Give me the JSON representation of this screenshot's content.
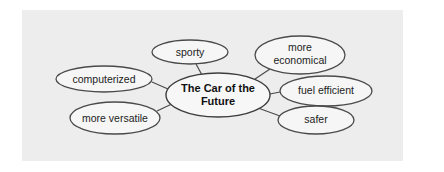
{
  "diagram": {
    "type": "concept-map",
    "center": {
      "label_line1": "The Car of the",
      "label_line2": "Future"
    },
    "nodes": [
      {
        "id": "sporty",
        "label_line1": "sporty"
      },
      {
        "id": "computerized",
        "label_line1": "computerized"
      },
      {
        "id": "more-versatile",
        "label_line1": "more versatile"
      },
      {
        "id": "more-economical",
        "label_line1": "more",
        "label_line2": "economical"
      },
      {
        "id": "fuel-efficient",
        "label_line1": "fuel efficient"
      },
      {
        "id": "safer",
        "label_line1": "safer"
      }
    ],
    "colors": {
      "panel_background": "#ededed",
      "page_background": "#ffffff",
      "stroke": "#4a4a4a",
      "text": "#1c1c1c"
    }
  }
}
